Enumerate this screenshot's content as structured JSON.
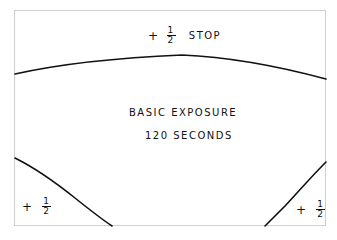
{
  "diagram": {
    "type": "exposure-burning-map",
    "top_region": {
      "sign": "+",
      "fraction_numerator": "1",
      "fraction_denominator": "2",
      "unit": "STOP"
    },
    "center_region": {
      "title": "BASIC EXPOSURE",
      "subtitle": "120 SECONDS"
    },
    "bottom_left_region": {
      "sign": "+",
      "fraction_numerator": "1",
      "fraction_denominator": "2"
    },
    "bottom_right_region": {
      "sign": "+",
      "fraction_numerator": "1",
      "fraction_denominator": "2"
    },
    "colors": {
      "ink": "#111111",
      "frame": "#cfcfcf",
      "background": "#ffffff"
    }
  }
}
